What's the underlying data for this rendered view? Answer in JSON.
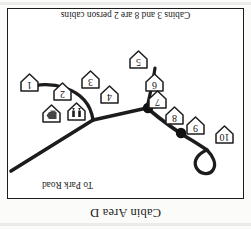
{
  "page": {
    "title": "Cabin Area D",
    "note": "Cabins 3 and 8 are 2 person cabins",
    "orientation": "upside-down",
    "ink_color": "#1c1c1c",
    "paper_color": "#ffffff"
  },
  "map": {
    "road_label": "To Park Road",
    "cabins": [
      {
        "label": "1",
        "x": 203,
        "y": 105
      },
      {
        "label": "2",
        "x": 170,
        "y": 96
      },
      {
        "label": "3",
        "x": 142,
        "y": 108
      },
      {
        "label": "4",
        "x": 123,
        "y": 93
      },
      {
        "label": "5",
        "x": 94,
        "y": 128
      },
      {
        "label": "6",
        "x": 78,
        "y": 105
      },
      {
        "label": "7",
        "x": 75,
        "y": 88
      },
      {
        "label": "8",
        "x": 58,
        "y": 72
      },
      {
        "label": "9",
        "x": 37,
        "y": 62
      },
      {
        "label": "10",
        "x": 8,
        "y": 53
      }
    ],
    "facilities": [
      {
        "icon": "restroom-icon",
        "x": 156,
        "y": 76
      },
      {
        "icon": "shower-icon",
        "x": 181,
        "y": 74
      }
    ],
    "junction_dots": [
      {
        "x": 95,
        "y": 90
      },
      {
        "x": 62,
        "y": 65
      }
    ]
  }
}
